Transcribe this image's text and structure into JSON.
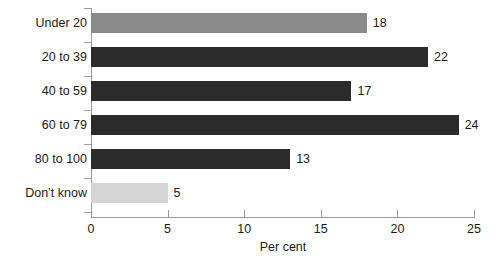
{
  "chart_data": {
    "type": "bar",
    "orientation": "horizontal",
    "title": "",
    "subtitle": "",
    "xlabel": "Per cent",
    "ylabel": "",
    "categories": [
      "Under 20",
      "20 to 39",
      "40 to 59",
      "60 to 79",
      "80 to 100",
      "Don’t know"
    ],
    "values": [
      18,
      22,
      17,
      24,
      13,
      5
    ],
    "value_labels": [
      "18",
      "22",
      "17",
      "24",
      "13",
      "5"
    ],
    "bar_colors": [
      "#8a8a8a",
      "#2b2b2b",
      "#2b2b2b",
      "#2b2b2b",
      "#2b2b2b",
      "#d4d4d4"
    ],
    "xlim": [
      0,
      25
    ],
    "xticks": [
      0,
      5,
      10,
      15,
      20,
      25
    ],
    "xtick_labels": [
      "0",
      "5",
      "10",
      "15",
      "20",
      "25"
    ],
    "grid": false,
    "legend": null,
    "axis_color": "#9a9a9a",
    "text_color": "#1a1a1a",
    "background": "#ffffff"
  }
}
